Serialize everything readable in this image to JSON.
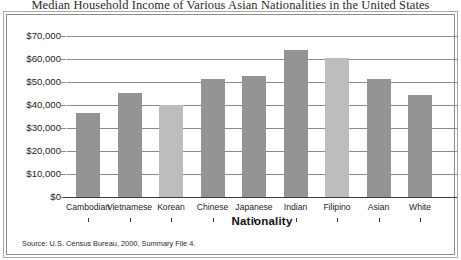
{
  "figure": {
    "title": "Median Household Income of Various Asian Nationalities in the United States",
    "source_note": "Source: U.S. Census Bureau, 2000, Summary File 4."
  },
  "colors": {
    "bar_dark": "#949494",
    "bar_light": "#bdbdbd",
    "gridline": "#8a8a8a",
    "axis": "#3a3a3a",
    "frame_outer": "#a8a8a8",
    "frame_inner": "#8d8d8d",
    "text": "#1d1d1d",
    "background": "#ffffff"
  },
  "chart_data": {
    "type": "bar",
    "title": "Median Household Income of Various Asian Nationalities in the United States",
    "xlabel": "Nationality",
    "ylabel": "",
    "ylim": [
      0,
      70000
    ],
    "ytick_step": 10000,
    "ytick_labels": [
      "$70,000",
      "$60,000",
      "$50,000",
      "$40,000",
      "$30,000",
      "$20,000",
      "$10,000",
      "$0"
    ],
    "ytick_values": [
      70000,
      60000,
      50000,
      40000,
      30000,
      20000,
      10000,
      0
    ],
    "grid": true,
    "legend": "none",
    "categories": [
      "Cambodian",
      "Vietnamese",
      "Korean",
      "Chinese",
      "Japanese",
      "Indian",
      "Filipino",
      "Asian",
      "White"
    ],
    "values": [
      36500,
      45000,
      40000,
      51500,
      52500,
      64000,
      60500,
      51500,
      44500
    ],
    "bar_styles": [
      "dark",
      "dark",
      "light",
      "dark",
      "dark",
      "dark",
      "light",
      "dark",
      "dark"
    ],
    "series": [
      {
        "name": "Median household income",
        "values": [
          36500,
          45000,
          40000,
          51500,
          52500,
          64000,
          60500,
          51500,
          44500
        ]
      }
    ]
  }
}
